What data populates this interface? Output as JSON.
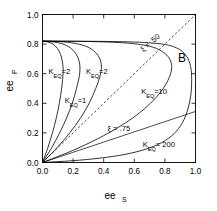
{
  "panel": {
    "label": "B"
  },
  "chart_data": {
    "type": "line",
    "title": "",
    "xlabel": "ee",
    "xlabel_sub": "S",
    "ylabel": "ee",
    "ylabel_sub": "P",
    "xlim": [
      0.0,
      1.0
    ],
    "ylim": [
      0.0,
      1.0
    ],
    "xticks": [
      "0.0",
      "0.2",
      "0.4",
      "0.6",
      "0.8",
      "1.0"
    ],
    "xtick_values": [
      0.0,
      0.2,
      0.4,
      0.6,
      0.8,
      1.0
    ],
    "yticks": [
      "0.0",
      "0.2",
      "0.4",
      "0.6",
      "0.8",
      "1.0"
    ],
    "ytick_values": [
      0.0,
      0.2,
      0.4,
      0.6,
      0.8,
      1.0
    ],
    "grid": false,
    "legend": "inline-annotations",
    "common_endpoints": {
      "lower": [
        0.0,
        0.0
      ],
      "upper": [
        0.0,
        0.82
      ]
    },
    "series": [
      {
        "name": "K_EQ = 2 (left)",
        "label_main": "K",
        "label_sub": "EQ",
        "label_value": "=2",
        "label_x": 0.04,
        "label_y": 0.6,
        "max_x": 0.135,
        "points": [
          [
            0.0,
            0.0
          ],
          [
            0.035,
            0.1
          ],
          [
            0.065,
            0.2
          ],
          [
            0.09,
            0.3
          ],
          [
            0.11,
            0.4
          ],
          [
            0.125,
            0.5
          ],
          [
            0.133,
            0.58
          ],
          [
            0.135,
            0.63
          ],
          [
            0.13,
            0.68
          ],
          [
            0.118,
            0.73
          ],
          [
            0.098,
            0.77
          ],
          [
            0.068,
            0.8
          ],
          [
            0.035,
            0.814
          ],
          [
            0.0,
            0.82
          ]
        ]
      },
      {
        "name": "K_EQ = 1",
        "label_main": "K",
        "label_sub": "EQ",
        "label_value": "=1",
        "label_x": 0.145,
        "label_y": 0.4,
        "max_x": 0.245,
        "points": [
          [
            0.0,
            0.0
          ],
          [
            0.06,
            0.1
          ],
          [
            0.112,
            0.2
          ],
          [
            0.157,
            0.3
          ],
          [
            0.195,
            0.4
          ],
          [
            0.222,
            0.5
          ],
          [
            0.24,
            0.58
          ],
          [
            0.245,
            0.64
          ],
          [
            0.238,
            0.69
          ],
          [
            0.218,
            0.735
          ],
          [
            0.182,
            0.775
          ],
          [
            0.13,
            0.802
          ],
          [
            0.068,
            0.815
          ],
          [
            0.0,
            0.82
          ]
        ]
      },
      {
        "name": "K_EQ = 2 (right)",
        "label_main": "K",
        "label_sub": "EQ",
        "label_value": "=2",
        "label_x": 0.285,
        "label_y": 0.6,
        "max_x": 0.385,
        "points": [
          [
            0.0,
            0.0
          ],
          [
            0.095,
            0.1
          ],
          [
            0.178,
            0.2
          ],
          [
            0.248,
            0.3
          ],
          [
            0.305,
            0.4
          ],
          [
            0.348,
            0.5
          ],
          [
            0.375,
            0.58
          ],
          [
            0.385,
            0.645
          ],
          [
            0.375,
            0.7
          ],
          [
            0.345,
            0.745
          ],
          [
            0.292,
            0.782
          ],
          [
            0.213,
            0.805
          ],
          [
            0.112,
            0.817
          ],
          [
            0.0,
            0.82
          ]
        ]
      },
      {
        "name": "K_EQ = 10",
        "label_main": "K",
        "label_sub": "EQ",
        "label_value": "=10",
        "label_x": 0.645,
        "label_y": 0.465,
        "max_x": 0.845,
        "points": [
          [
            0.0,
            0.0
          ],
          [
            0.195,
            0.08
          ],
          [
            0.36,
            0.16
          ],
          [
            0.5,
            0.24
          ],
          [
            0.615,
            0.32
          ],
          [
            0.705,
            0.4
          ],
          [
            0.775,
            0.48
          ],
          [
            0.82,
            0.555
          ],
          [
            0.843,
            0.625
          ],
          [
            0.838,
            0.685
          ],
          [
            0.8,
            0.737
          ],
          [
            0.72,
            0.78
          ],
          [
            0.575,
            0.805
          ],
          [
            0.33,
            0.817
          ],
          [
            0.0,
            0.82
          ]
        ]
      },
      {
        "name": "K_EQ = 200",
        "label_main": "K",
        "label_sub": "EQ",
        "label_value": "= 200",
        "label_x": 0.655,
        "label_y": 0.105,
        "max_x": 0.975,
        "points": [
          [
            0.0,
            0.0
          ],
          [
            0.195,
            0.012
          ],
          [
            0.38,
            0.03
          ],
          [
            0.54,
            0.055
          ],
          [
            0.675,
            0.09
          ],
          [
            0.78,
            0.135
          ],
          [
            0.86,
            0.195
          ],
          [
            0.915,
            0.27
          ],
          [
            0.95,
            0.36
          ],
          [
            0.97,
            0.46
          ],
          [
            0.975,
            0.56
          ],
          [
            0.968,
            0.648
          ],
          [
            0.94,
            0.72
          ],
          [
            0.875,
            0.775
          ],
          [
            0.745,
            0.805
          ],
          [
            0.48,
            0.817
          ],
          [
            0.0,
            0.82
          ]
        ]
      }
    ],
    "xi_lines": [
      {
        "name": "xi-050",
        "label_symbol": "ξ",
        "label_value": "=  .50",
        "label_text": "ξ =  .50",
        "from": [
          0.0,
          0.0
        ],
        "to": [
          1.0,
          1.0
        ],
        "dashed": true,
        "label_x": 0.66,
        "label_y": 0.745,
        "rotation": -42
      },
      {
        "name": "xi-075",
        "label_symbol": "ξ",
        "label_value": "=  .75",
        "label_text": "ξ =  .75",
        "from": [
          0.0,
          0.0
        ],
        "to": [
          1.0,
          0.345
        ],
        "dashed": false,
        "label_x": 0.425,
        "label_y": 0.215,
        "rotation": 0
      }
    ]
  },
  "colors": {
    "background": "#ffffff",
    "foreground": "#000000"
  }
}
